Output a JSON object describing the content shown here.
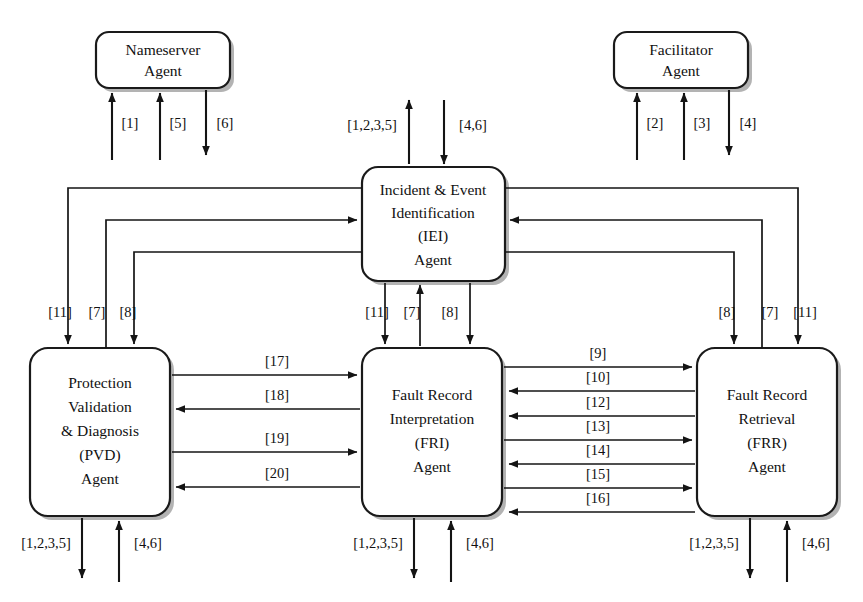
{
  "diagram": {
    "type": "block-diagram",
    "background_color": "#ffffff",
    "line_color": "#141414",
    "nodes": [
      {
        "id": "nameserver",
        "label_lines": [
          "Nameserver",
          "Agent"
        ],
        "x": 96,
        "y": 32,
        "w": 134,
        "h": 56
      },
      {
        "id": "facilitator",
        "label_lines": [
          "Facilitator",
          "Agent"
        ],
        "x": 614,
        "y": 32,
        "w": 134,
        "h": 56
      },
      {
        "id": "iei",
        "label_lines": [
          "Incident & Event",
          "Identification",
          "(IEI)",
          "Agent"
        ],
        "x": 362,
        "y": 167,
        "w": 143,
        "h": 114
      },
      {
        "id": "pvd",
        "label_lines": [
          "Protection",
          "Validation",
          "& Diagnosis",
          "(PVD)",
          "Agent"
        ],
        "x": 30,
        "y": 348,
        "w": 140,
        "h": 168
      },
      {
        "id": "fri",
        "label_lines": [
          "Fault Record",
          "Interpretation",
          "(FRI)",
          "Agent"
        ],
        "x": 362,
        "y": 348,
        "w": 140,
        "h": 168
      },
      {
        "id": "frr",
        "label_lines": [
          "Fault Record",
          "Retrieval",
          "(FRR)",
          "Agent"
        ],
        "x": 697,
        "y": 348,
        "w": 140,
        "h": 168
      }
    ],
    "external_links": {
      "nameserver": [
        {
          "label": "[1]",
          "direction": "up",
          "x": 112
        },
        {
          "label": "[5]",
          "direction": "up",
          "x": 160
        },
        {
          "label": "[6]",
          "direction": "down",
          "x": 206
        }
      ],
      "facilitator": [
        {
          "label": "[2]",
          "direction": "up",
          "x": 637
        },
        {
          "label": "[3]",
          "direction": "up",
          "x": 684
        },
        {
          "label": "[4]",
          "direction": "down",
          "x": 729
        }
      ],
      "iei_top": [
        {
          "label": "[1,2,3,5]",
          "direction": "up",
          "x": 409
        },
        {
          "label": "[4,6]",
          "direction": "down",
          "x": 444
        }
      ],
      "pvd_bottom": [
        {
          "label": "[1,2,3,5]",
          "direction": "down",
          "x": 82
        },
        {
          "label": "[4,6]",
          "direction": "up",
          "x": 119
        }
      ],
      "fri_bottom": [
        {
          "label": "[1,2,3,5]",
          "direction": "down",
          "x": 414
        },
        {
          "label": "[4,6]",
          "direction": "up",
          "x": 451
        }
      ],
      "frr_bottom": [
        {
          "label": "[1,2,3,5]",
          "direction": "down",
          "x": 750
        },
        {
          "label": "[4,6]",
          "direction": "up",
          "x": 787
        }
      ]
    },
    "iei_bus_labels": {
      "left_column": [
        "[11]",
        "[7]",
        "[8]"
      ],
      "center_column": [
        "[11]",
        "[7]",
        "[8]"
      ],
      "right_column": [
        "[8]",
        "[7]",
        "[11]"
      ]
    },
    "pvd_fri_links": [
      {
        "label": "[17]",
        "direction": "right"
      },
      {
        "label": "[18]",
        "direction": "left"
      },
      {
        "label": "[19]",
        "direction": "right"
      },
      {
        "label": "[20]",
        "direction": "left"
      }
    ],
    "fri_frr_links": [
      {
        "label": "[9]",
        "direction": "right"
      },
      {
        "label": "[10]",
        "direction": "left"
      },
      {
        "label": "[12]",
        "direction": "left"
      },
      {
        "label": "[13]",
        "direction": "right"
      },
      {
        "label": "[14]",
        "direction": "left"
      },
      {
        "label": "[15]",
        "direction": "right"
      },
      {
        "label": "[16]",
        "direction": "left"
      }
    ]
  }
}
